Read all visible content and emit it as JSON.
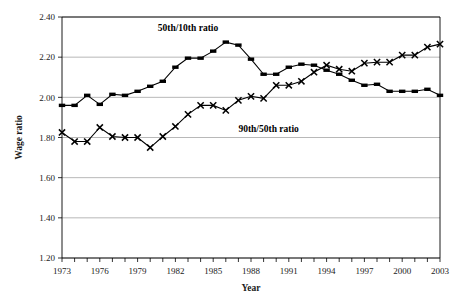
{
  "chart_data": {
    "type": "line",
    "title": "",
    "xlabel": "Year",
    "ylabel": "Wage ratio",
    "xlim": [
      1973,
      2003
    ],
    "ylim": [
      1.2,
      2.4
    ],
    "yticks": [
      "1.20",
      "1.40",
      "1.60",
      "1.80",
      "2.00",
      "2.20",
      "2.40"
    ],
    "ytick_values": [
      1.2,
      1.4,
      1.6,
      1.8,
      2.0,
      2.2,
      2.4
    ],
    "xticks": [
      "1973",
      "1976",
      "1979",
      "1982",
      "1985",
      "1988",
      "1991",
      "1994",
      "1997",
      "2000",
      "2003"
    ],
    "xtick_values": [
      1973,
      1976,
      1979,
      1982,
      1985,
      1988,
      1991,
      1994,
      1997,
      2000,
      2003
    ],
    "grid": "horizontal",
    "legend": "inline-annotations",
    "x": [
      1973,
      1974,
      1975,
      1976,
      1977,
      1978,
      1979,
      1980,
      1981,
      1982,
      1983,
      1984,
      1985,
      1986,
      1987,
      1988,
      1989,
      1990,
      1991,
      1992,
      1993,
      1994,
      1995,
      1996,
      1997,
      1998,
      1999,
      2000,
      2001,
      2002,
      2003
    ],
    "series": [
      {
        "name": "50th/10th ratio",
        "marker": "filled-square",
        "values": [
          1.96,
          1.96,
          2.01,
          1.965,
          2.015,
          2.01,
          2.03,
          2.055,
          2.08,
          2.15,
          2.195,
          2.195,
          2.23,
          2.275,
          2.26,
          2.19,
          2.115,
          2.115,
          2.15,
          2.165,
          2.16,
          2.135,
          2.115,
          2.085,
          2.06,
          2.065,
          2.03,
          2.03,
          2.03,
          2.04,
          2.01
        ]
      },
      {
        "name": "90th/50th ratio",
        "marker": "x-cross",
        "values": [
          1.825,
          1.78,
          1.78,
          1.85,
          1.805,
          1.8,
          1.8,
          1.75,
          1.805,
          1.855,
          1.915,
          1.96,
          1.96,
          1.935,
          1.985,
          2.005,
          1.995,
          2.06,
          2.06,
          2.08,
          2.125,
          2.16,
          2.14,
          2.13,
          2.17,
          2.175,
          2.175,
          2.21,
          2.21,
          2.25,
          2.265
        ]
      }
    ],
    "annotations": [
      {
        "text": "50th/10th ratio",
        "x": 1983.0,
        "y": 2.33
      },
      {
        "text": "90th/50th ratio",
        "x": 1989.4,
        "y": 1.825
      }
    ]
  }
}
